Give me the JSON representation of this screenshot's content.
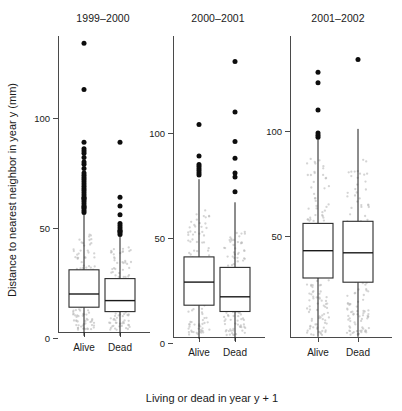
{
  "figure": {
    "xlabel": "Living or dead in year y + 1",
    "ylabel": "Distance to nearest neighbor in year y (mm)",
    "background": "#ffffff",
    "ink": "#1a1a1a",
    "outlier_color": "#0d0d0d",
    "jitter_color": "#b9b9b9"
  },
  "chart_data": {
    "type": "boxplot",
    "title": "",
    "xlabel": "Living or dead in year y + 1",
    "ylabel": "Distance to nearest neighbor in year y (mm)",
    "grid": false,
    "legend": "none",
    "units": "mm",
    "panels": [
      {
        "title": "1999–2000",
        "ylim": [
          -4,
          140
        ],
        "yticks": [
          0,
          50,
          100
        ],
        "ytick_labels": [
          "0",
          "50",
          "100"
        ],
        "categories": [
          "Alive",
          "Dead"
        ],
        "boxes": [
          {
            "label": "Alive",
            "min": 1,
            "q1": 14,
            "median": 20,
            "q3": 31,
            "whisker_low": 1,
            "whisker_high": 56,
            "outliers": [
              57,
              58,
              59,
              59.5,
              60,
              61,
              62,
              63,
              63.5,
              64,
              65,
              66,
              67,
              68,
              69,
              70,
              71,
              72,
              73,
              74,
              75,
              77,
              79,
              80,
              82,
              84,
              85,
              86,
              89,
              113,
              134
            ]
          },
          {
            "label": "Dead",
            "min": 1,
            "q1": 12,
            "median": 17,
            "q3": 27,
            "whisker_low": 1,
            "whisker_high": 46,
            "outliers": [
              47,
              48,
              48.5,
              49,
              50,
              51,
              52,
              56,
              60,
              64,
              89
            ]
          }
        ]
      },
      {
        "title": "2000–2001",
        "ylim": [
          -4,
          140
        ],
        "yticks": [
          0,
          50,
          100
        ],
        "ytick_labels": [
          "0",
          "50",
          "100"
        ],
        "categories": [
          "Alive",
          "Dead"
        ],
        "boxes": [
          {
            "label": "Alive",
            "min": 2,
            "q1": 18,
            "median": 29,
            "q3": 41,
            "whisker_low": 2,
            "whisker_high": 78,
            "outliers": [
              80,
              81,
              82,
              83,
              84,
              85,
              89,
              104
            ]
          },
          {
            "label": "Dead",
            "min": 1,
            "q1": 15,
            "median": 22,
            "q3": 36,
            "whisker_low": 1,
            "whisker_high": 67,
            "outliers": [
              72,
              79,
              81,
              88,
              96,
              110,
              134
            ]
          }
        ]
      },
      {
        "title": "2001–2002",
        "ylim": [
          -4,
          140
        ],
        "yticks": [
          50,
          100
        ],
        "ytick_labels": [
          "50",
          "100"
        ],
        "categories": [
          "Alive",
          "Dead"
        ],
        "boxes": [
          {
            "label": "Alive",
            "min": 2,
            "q1": 30,
            "median": 43,
            "q3": 56,
            "whisker_low": 2,
            "whisker_high": 96,
            "outliers": [
              97,
              98,
              99,
              110,
              123,
              128
            ]
          },
          {
            "label": "Dead",
            "min": 2,
            "q1": 28,
            "median": 42,
            "q3": 57,
            "whisker_low": 2,
            "whisker_high": 101,
            "outliers": [
              134
            ]
          }
        ]
      }
    ]
  }
}
